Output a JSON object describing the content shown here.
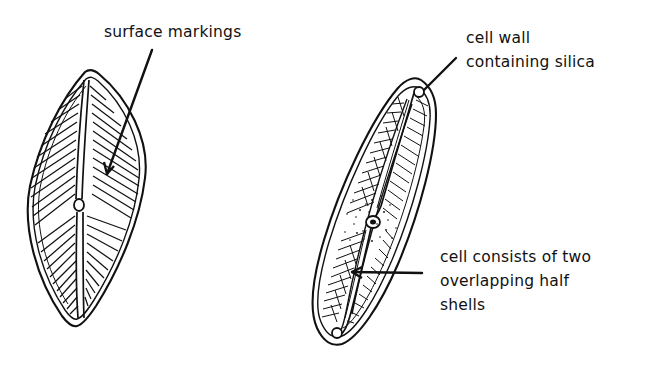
{
  "figure": {
    "background_color": "#ffffff",
    "ink_color": "#111111",
    "width": 658,
    "height": 375
  },
  "labels": {
    "surface_markings": {
      "text": "surface markings",
      "lines": [
        "surface markings"
      ],
      "points_to": "left-diatom-striae"
    },
    "cell_wall": {
      "text": "cell wall containing silica",
      "lines": [
        "cell wall",
        "containing silica"
      ],
      "points_to": "right-diatom-apex"
    },
    "half_shells": {
      "text": "cell consists of two overlapping half shells",
      "lines": [
        "cell consists of two",
        "overlapping half",
        "shells"
      ],
      "points_to": "right-diatom-girdle"
    }
  },
  "specimens": [
    {
      "name": "left-diatom-valve-view",
      "description": "lens shaped diatom valve with radiating striae, central raphe and central nodule",
      "orientation": "vertical"
    },
    {
      "name": "right-diatom-tilted-view",
      "description": "elongate diatom tilted, showing overlapping epitheca and hypotheca with striae, polar nodules and central nodule",
      "orientation": "tilted"
    }
  ],
  "leader_lines": [
    {
      "name": "leader-surface-markings",
      "from": [
        152,
        50
      ],
      "to": [
        105,
        176
      ]
    },
    {
      "name": "leader-cell-wall",
      "from": [
        456,
        58
      ],
      "to": [
        424,
        90
      ]
    },
    {
      "name": "leader-half-shells",
      "from": [
        422,
        273
      ],
      "to": [
        352,
        272
      ]
    }
  ]
}
